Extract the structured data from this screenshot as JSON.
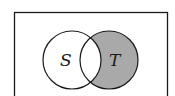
{
  "diagram": {
    "type": "venn",
    "universe": {
      "label": ""
    },
    "sets": [
      {
        "name": "S",
        "label": "S"
      },
      {
        "name": "T",
        "label": "T"
      }
    ],
    "shaded_region": "T \\ S",
    "colors": {
      "shade": "#a9a9a9",
      "stroke": "#1a1a1a",
      "background": "#ffffff"
    }
  }
}
